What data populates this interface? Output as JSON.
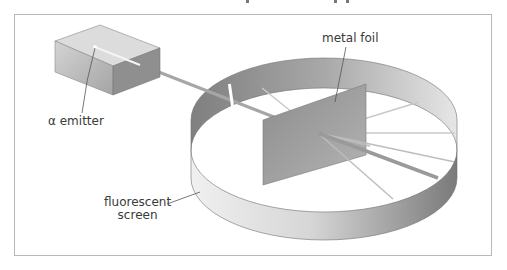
{
  "figure": {
    "labels": {
      "emitter": "α emitter",
      "foil": "metal foil",
      "screen_line1": "fluorescent",
      "screen_line2": "screen"
    }
  },
  "colors": {
    "frame": "#b8b8b8",
    "box_top": "#d9d9d9",
    "box_front": "#b9b9b9",
    "box_side": "#8f8f8f",
    "beam": "#a6a6a6",
    "foil": "#9a9a9a",
    "ring_back": "#9b9b9b",
    "ring_front": "#d8d8d8",
    "rays": "#c4c4c4",
    "leader": "#555555"
  }
}
